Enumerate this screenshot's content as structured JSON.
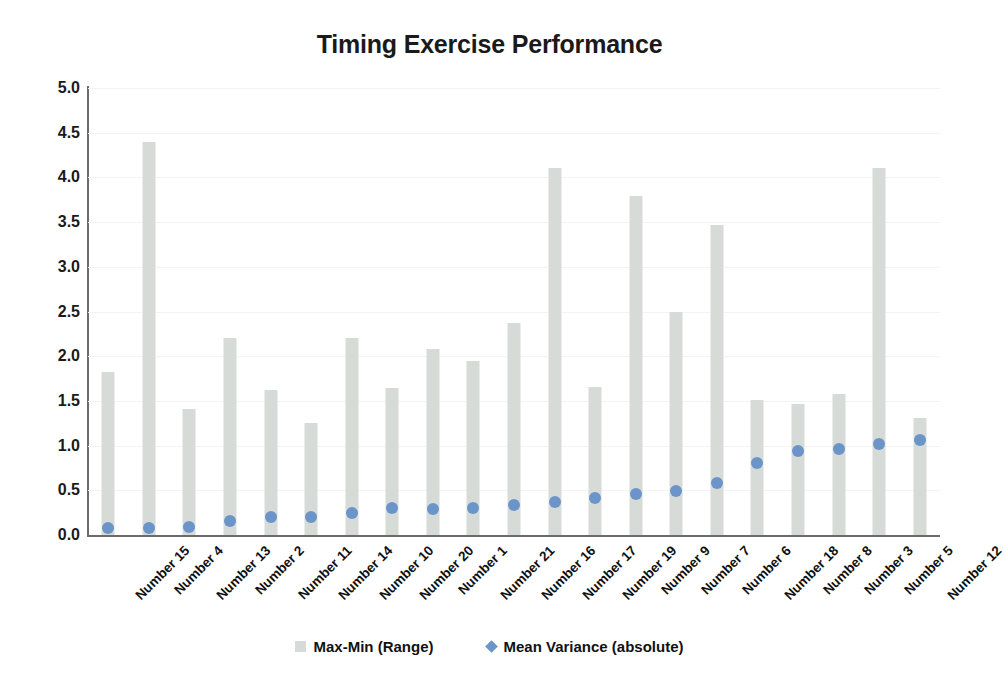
{
  "chart_data": {
    "type": "bar",
    "title": "Timing Exercise Performance",
    "xlabel": "",
    "ylabel": "",
    "ylim": [
      0.0,
      5.0
    ],
    "ytick_step": 0.5,
    "ytick_labels": [
      "5.0",
      "4.5",
      "4.0",
      "3.5",
      "3.0",
      "2.5",
      "2.0",
      "1.5",
      "1.0",
      "0.5",
      "0.0"
    ],
    "grid": true,
    "legend_position": "bottom",
    "categories": [
      "Number 15",
      "Number 4",
      "Number 13",
      "Number 2",
      "Number 11",
      "Number 14",
      "Number 10",
      "Number 20",
      "Number 1",
      "Number 21",
      "Number 16",
      "Number 17",
      "Number 19",
      "Number 9",
      "Number 7",
      "Number 6",
      "Number 18",
      "Number 8",
      "Number 3",
      "Number 5",
      "Number 12"
    ],
    "series": [
      {
        "name": "Max-Min (Range)",
        "type": "bar",
        "color": "#d7dbd8",
        "values": [
          1.82,
          4.4,
          1.41,
          2.2,
          1.62,
          1.25,
          2.2,
          1.64,
          2.08,
          1.95,
          2.37,
          4.1,
          1.66,
          3.79,
          2.5,
          3.47,
          1.51,
          1.47,
          1.58,
          4.11,
          1.31
        ]
      },
      {
        "name": "Mean Variance (absolute)",
        "type": "scatter",
        "color": "#6b95c9",
        "marker": "diamond",
        "values": [
          0.08,
          0.08,
          0.09,
          0.16,
          0.2,
          0.2,
          0.25,
          0.3,
          0.29,
          0.3,
          0.34,
          0.37,
          0.41,
          0.46,
          0.49,
          0.58,
          0.81,
          0.94,
          0.96,
          1.02,
          1.06
        ]
      }
    ]
  },
  "legend": {
    "items": [
      {
        "label": "Max-Min (Range)",
        "marker": "square",
        "color": "#d7dbd8"
      },
      {
        "label": "Mean Variance (absolute)",
        "marker": "diamond",
        "color": "#6b95c9"
      }
    ]
  }
}
